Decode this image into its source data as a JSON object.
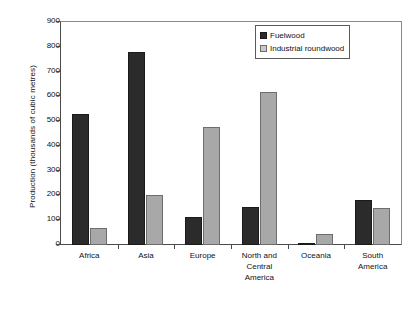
{
  "chart_data": {
    "type": "bar",
    "title": "",
    "xlabel": "",
    "ylabel": "Production (thousands of cubic metres)",
    "ylim": [
      0,
      900
    ],
    "ytick_values": [
      900,
      800,
      700,
      600,
      500,
      400,
      300,
      200,
      100,
      0
    ],
    "ytick_labels": [
      "900",
      "800",
      "700",
      "600",
      "500",
      "400",
      "300",
      "200",
      "100",
      "0"
    ],
    "grid": false,
    "legend_position": "top-right",
    "categories": [
      "Africa",
      "Asia",
      "Europe",
      "North and Central America",
      "Oceania",
      "South America"
    ],
    "category_label_lines": [
      [
        "Africa"
      ],
      [
        "Asia"
      ],
      [
        "Europe"
      ],
      [
        "North and",
        "Central",
        "America"
      ],
      [
        "Oceania"
      ],
      [
        "South",
        "America"
      ]
    ],
    "series": [
      {
        "name": "Fuelwood",
        "color": "#2b2b2b",
        "values": [
          530,
          780,
          112,
          152,
          10,
          182
        ]
      },
      {
        "name": "Industrial roundwood",
        "color": "#a8a8a8",
        "values": [
          68,
          202,
          478,
          616,
          45,
          150
        ]
      }
    ]
  },
  "legend": {
    "items": [
      {
        "label": "Fuelwood",
        "swatch": "dark"
      },
      {
        "label": "Industrial roundwood",
        "swatch": "light"
      }
    ]
  },
  "colors": {
    "fuelwood": "#2b2b2b",
    "industrial_roundwood": "#a8a8a8",
    "axis": "#4a4a4a",
    "frame": "#8a8a8a",
    "background": "#ffffff"
  }
}
